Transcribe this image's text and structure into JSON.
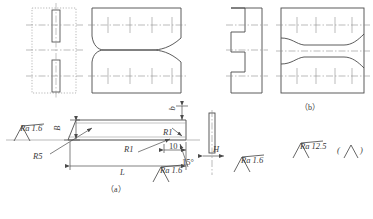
{
  "figure": {
    "type": "engineering-orthographic-drawing",
    "caption_a": "（a）",
    "caption_b": "（b）",
    "bottom_caption": ""
  },
  "dimensions": {
    "width_B": "B",
    "length_L": "L",
    "thickness_b": "b",
    "height_H": "H",
    "radius_R5": "R5",
    "radius_R1_left": "R1",
    "radius_R1_right": "R1",
    "chamfer_len": "10",
    "angle": "15°"
  },
  "roughness": {
    "ra_left": "Ra 1.6",
    "ra_bottom_mid": "Ra 1.6",
    "ra_bottom_right": "Ra 1.6",
    "ra_general": "Ra 12.5",
    "ra_bracket_open": "(",
    "ra_bracket_close": ")"
  },
  "colors": {
    "line": "#4a4a4a",
    "line_light": "#8d8d8d",
    "text": "#3a3a3a",
    "background": "#ffffff"
  }
}
